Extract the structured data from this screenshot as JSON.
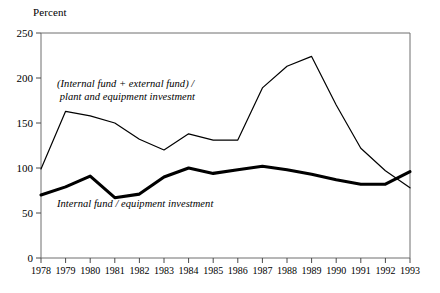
{
  "axis_unit_label": "Percent",
  "y_ticks": [
    0,
    50,
    100,
    150,
    200,
    250
  ],
  "y_tick_labels": [
    "0",
    "50",
    "100",
    "150",
    "200",
    "250"
  ],
  "x_tick_labels": [
    "1978",
    "1979",
    "1980",
    "1981",
    "1982",
    "1983",
    "1984",
    "1985",
    "1986",
    "1987",
    "1988",
    "1989",
    "1990",
    "1991",
    "1992",
    "1993"
  ],
  "annotations": {
    "total_funds_line1": "(Internal fund + external fund) /",
    "total_funds_line2": " plant and equipment investment",
    "internal_funds": "Internal fund / equipment investment"
  },
  "colors": {
    "line": "#000000",
    "axis": "#6e6e6e",
    "background": "#ffffff"
  },
  "chart_data": {
    "type": "line",
    "title": "",
    "subtitle": "",
    "xlabel": "",
    "ylabel": "Percent",
    "ylim": [
      0,
      250
    ],
    "xlim": [
      1978,
      1993
    ],
    "grid": false,
    "legend": "inline-annotations",
    "x": [
      1978,
      1979,
      1980,
      1981,
      1982,
      1983,
      1984,
      1985,
      1986,
      1987,
      1988,
      1989,
      1990,
      1991,
      1992,
      1993
    ],
    "series": [
      {
        "name": "(Internal fund + external fund) / plant and equipment investment",
        "style": "thin",
        "values": [
          99,
          163,
          158,
          150,
          132,
          120,
          138,
          131,
          131,
          189,
          213,
          224,
          170,
          122,
          97,
          78
        ]
      },
      {
        "name": "Internal fund / equipment investment",
        "style": "thick",
        "values": [
          70,
          79,
          91,
          67,
          71,
          90,
          100,
          94,
          98,
          102,
          98,
          93,
          87,
          82,
          82,
          96
        ]
      }
    ],
    "annotations": [
      {
        "text": "(Internal fund + external fund) / plant and equipment investment",
        "x": 1979.0,
        "y": 185
      },
      {
        "text": "Internal fund / equipment investment",
        "x": 1979.0,
        "y": 52
      }
    ]
  }
}
